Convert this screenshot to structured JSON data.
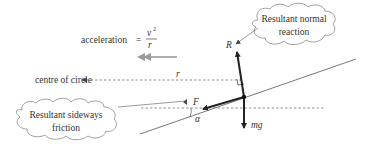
{
  "figure": {
    "type": "free-body diagram"
  },
  "labels": {
    "acceleration_word": "acceleration",
    "equals": "=",
    "accel_numerator": "v",
    "accel_numerator_power": "2",
    "accel_denominator": "r",
    "centre_of_circle": "centre of circle",
    "radius": "r",
    "normal_force": "R",
    "friction_force": "F",
    "angle": "α",
    "weight": "mg"
  },
  "callouts": {
    "normal_reaction": {
      "line1": "Resultant normal",
      "line2": "reaction"
    },
    "sideways_friction": {
      "line1": "Resultant sideways",
      "line2": "friction"
    }
  },
  "colors": {
    "ink": "#222222",
    "text": "#333333",
    "acceleration_arrow": "#9a9a9a",
    "dashed": "#777777",
    "cloud_stroke": "#888888"
  }
}
